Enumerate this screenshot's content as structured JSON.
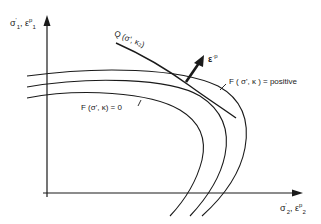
{
  "diagram": {
    "axes": {
      "y_label": {
        "sym1": "σ",
        "sub1": "1",
        "sup1": "'",
        "sep": ", ",
        "sym2": "ε",
        "sub2": "1",
        "sup2": "p"
      },
      "x_label": {
        "sym1": "σ",
        "sub1": "2",
        "sup1": "'",
        "sep": ", ",
        "sym2": "ε",
        "sub2": "2",
        "sup2": "p"
      }
    },
    "curves": {
      "plastic_potential_label": "Q (σ', κ₂)",
      "yield_zero_label": "F (σ', κ) = 0",
      "yield_positive_label": "F ( σ', κ ) = positive"
    },
    "vectors": {
      "plastic_strain_label": "ε",
      "plastic_strain_sup": "·p"
    },
    "colors": {
      "line": "#1a1a1a",
      "background": "#ffffff"
    }
  }
}
